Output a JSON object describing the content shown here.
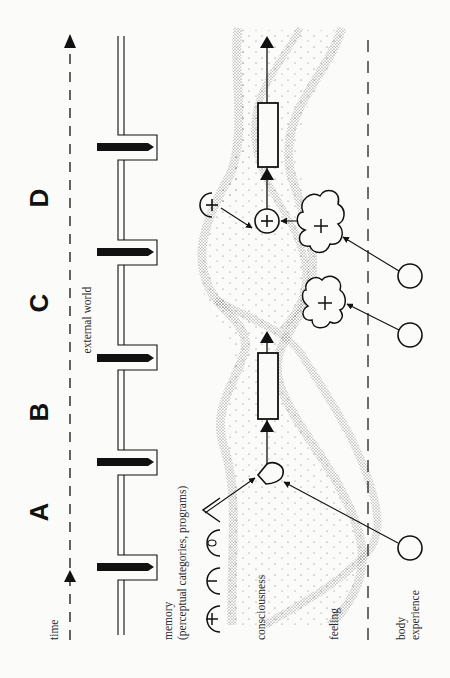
{
  "diagram": {
    "orientation": "rotated 90deg counter-clockwise (text reads bottom-to-top)",
    "phase_labels": [
      "A",
      "B",
      "C",
      "D"
    ],
    "rows": {
      "time": "time",
      "external_world": "external world",
      "memory_line1": "memory",
      "memory_line2": "(perceptual categories, programs)",
      "consciousness": "consciousness",
      "feeling": "feeling",
      "body_line1": "body",
      "body_line2": "experience"
    },
    "memory_symbols": [
      "+",
      "−",
      "0",
      "<"
    ],
    "event_count": 5,
    "nodes": {
      "memory_plus": "+",
      "conscious_plus": "+",
      "cloud_upper": "+",
      "cloud_lower": "+"
    },
    "colors": {
      "ink": "#111111",
      "stipple": "#6f6f6f",
      "background": "#fbfbfa"
    }
  }
}
